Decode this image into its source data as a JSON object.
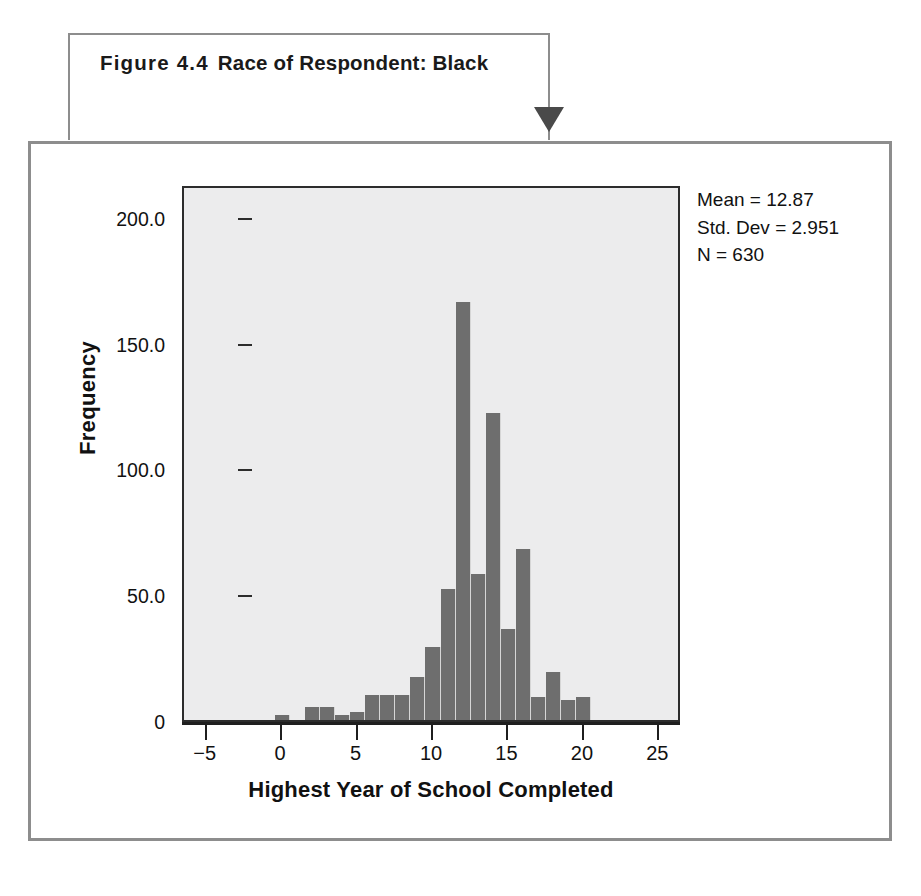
{
  "figure": {
    "number": "Figure 4.4",
    "caption": "Race of Respondent: Black",
    "arrow": "down-arrow-marker"
  },
  "stats": {
    "mean_line": "Mean = 12.87",
    "std_dev_line": "Std. Dev = 2.951",
    "n_line": "N = 630"
  },
  "colors": {
    "bar_fill": "#6e6e6e",
    "plot_background": "#ececed",
    "frame_border": "#8d8d8d",
    "axis": "#1f1f1f",
    "arrow": "#4a4a4a"
  },
  "chart_data": {
    "type": "bar",
    "title": "Race of Respondent: Black",
    "xlabel": "Highest Year of School Completed",
    "ylabel": "Frequency",
    "xlim": [
      -6.5,
      26.5
    ],
    "ylim": [
      0,
      213
    ],
    "grid": false,
    "legend": null,
    "annotations": [
      "Mean = 12.87",
      "Std. Dev = 2.951",
      "N = 630"
    ],
    "x_tick_labels": [
      "−5",
      "0",
      "5",
      "10",
      "15",
      "20",
      "25"
    ],
    "x_ticks": [
      -5,
      0,
      5,
      10,
      15,
      20,
      25
    ],
    "y_tick_labels": [
      "0",
      "50.0",
      "100.0",
      "150.0",
      "200.0"
    ],
    "y_ticks": [
      0,
      50,
      100,
      150,
      200
    ],
    "categories": [
      0,
      1,
      2,
      3,
      4,
      5,
      6,
      7,
      8,
      9,
      10,
      11,
      12,
      13,
      14,
      15,
      16,
      17,
      18,
      19,
      20
    ],
    "values": [
      2,
      0,
      5,
      5,
      2,
      3,
      10,
      10,
      10,
      17,
      29,
      52,
      166,
      58,
      122,
      36,
      68,
      9,
      19,
      8,
      9
    ],
    "bars": [
      {
        "x": 0,
        "frequency": 2
      },
      {
        "x": 1,
        "frequency": 0
      },
      {
        "x": 2,
        "frequency": 5
      },
      {
        "x": 3,
        "frequency": 5
      },
      {
        "x": 4,
        "frequency": 2
      },
      {
        "x": 5,
        "frequency": 3
      },
      {
        "x": 6,
        "frequency": 10
      },
      {
        "x": 7,
        "frequency": 10
      },
      {
        "x": 8,
        "frequency": 10
      },
      {
        "x": 9,
        "frequency": 17
      },
      {
        "x": 10,
        "frequency": 29
      },
      {
        "x": 11,
        "frequency": 52
      },
      {
        "x": 12,
        "frequency": 166
      },
      {
        "x": 13,
        "frequency": 58
      },
      {
        "x": 14,
        "frequency": 122
      },
      {
        "x": 15,
        "frequency": 36
      },
      {
        "x": 16,
        "frequency": 68
      },
      {
        "x": 17,
        "frequency": 9
      },
      {
        "x": 18,
        "frequency": 19
      },
      {
        "x": 19,
        "frequency": 8
      },
      {
        "x": 20,
        "frequency": 9
      }
    ]
  }
}
